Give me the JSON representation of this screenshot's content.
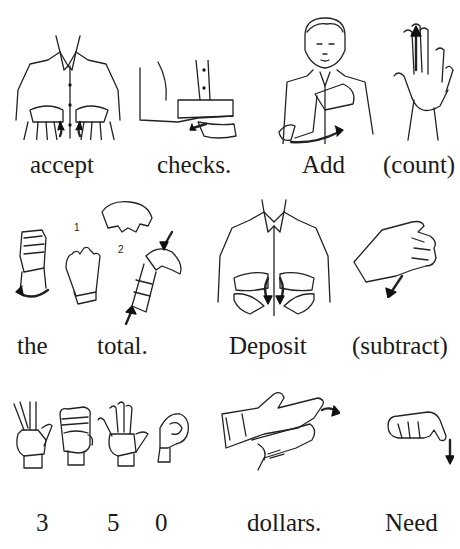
{
  "rows": [
    {
      "signs": [
        {
          "label": "accept",
          "icon": "accept-sign-illustration"
        },
        {
          "label": "checks.",
          "icon": "checks-sign-illustration"
        },
        {
          "label": "Add",
          "icon": "add-sign-illustration"
        },
        {
          "label": "(count)",
          "icon": "count-sign-illustration"
        }
      ]
    },
    {
      "signs": [
        {
          "label": "the",
          "icon": "the-sign-illustration"
        },
        {
          "label": "total.",
          "icon": "total-sign-illustration",
          "steps": [
            "1",
            "2"
          ]
        },
        {
          "label": "Deposit",
          "icon": "deposit-sign-illustration"
        },
        {
          "label": "(subtract)",
          "icon": "subtract-sign-illustration"
        }
      ]
    },
    {
      "signs": [
        {
          "label": "3",
          "icon": "number-3-handshape"
        },
        {
          "label": "5",
          "icon": "number-5-handshape"
        },
        {
          "label": "0",
          "icon": "number-0-handshape"
        },
        {
          "label": "dollars.",
          "icon": "dollars-sign-illustration"
        },
        {
          "label": "Need",
          "icon": "need-sign-illustration"
        }
      ]
    }
  ]
}
